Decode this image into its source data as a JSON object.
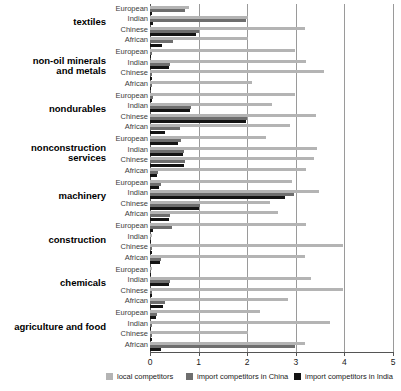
{
  "chart_data": {
    "type": "bar",
    "orientation": "horizontal",
    "title": "",
    "subtitle": "",
    "xlabel": "",
    "ylabel": "",
    "xlim": [
      0,
      5
    ],
    "xticks": [
      0,
      1,
      2,
      3,
      4,
      5
    ],
    "xtick_labels": [
      "0",
      "1",
      "2",
      "3",
      "4",
      "5"
    ],
    "grid": true,
    "grid_axis": "x",
    "legend_position": "bottom",
    "legend": [
      {
        "name": "local competitors",
        "color": "#b4b4b4"
      },
      {
        "name": "import competitors in China",
        "color": "#6e6e6e"
      },
      {
        "name": "import competitors in India",
        "color": "#141414"
      }
    ],
    "series": [
      {
        "name": "local competitors",
        "color": "#b4b4b4"
      },
      {
        "name": "import competitors in China",
        "color": "#6e6e6e"
      },
      {
        "name": "import competitors in India",
        "color": "#141414"
      }
    ],
    "subcategories": [
      "European",
      "Indian",
      "Chinese",
      "African"
    ],
    "categories": [
      "textiles",
      "non-oil minerals and metals",
      "nondurables",
      "nonconstruction services",
      "machinery",
      "construction",
      "chemicals",
      "agriculture and food"
    ],
    "groups": [
      {
        "category": "textiles",
        "category_lines": [
          "textiles"
        ],
        "rows": [
          {
            "subcategory": "European",
            "local competitors": 0.8,
            "import competitors in China": 0.72,
            "import competitors in India": 0.05
          },
          {
            "subcategory": "Indian",
            "local competitors": 2.02,
            "import competitors in China": 1.98,
            "import competitors in India": 0.06
          },
          {
            "subcategory": "Chinese",
            "local competitors": 3.18,
            "import competitors in China": 1.0,
            "import competitors in India": 0.95
          },
          {
            "subcategory": "African",
            "local competitors": 2.02,
            "import competitors in China": 0.48,
            "import competitors in India": 0.24
          }
        ]
      },
      {
        "category": "non-oil minerals and metals",
        "category_lines": [
          "non-oil minerals",
          "and metals"
        ],
        "rows": [
          {
            "subcategory": "European",
            "local competitors": 2.98,
            "import competitors in China": 0.04,
            "import competitors in India": 0.03
          },
          {
            "subcategory": "Indian",
            "local competitors": 3.22,
            "import competitors in China": 0.42,
            "import competitors in India": 0.4
          },
          {
            "subcategory": "Chinese",
            "local competitors": 3.58,
            "import competitors in China": 0.05,
            "import competitors in India": 0.04
          },
          {
            "subcategory": "African",
            "local competitors": 2.1,
            "import competitors in China": 0.04,
            "import competitors in India": 0.03
          }
        ]
      },
      {
        "category": "nondurables",
        "category_lines": [
          "nondurables"
        ],
        "rows": [
          {
            "subcategory": "European",
            "local competitors": 2.98,
            "import competitors in China": 0.06,
            "import competitors in India": 0.04
          },
          {
            "subcategory": "Indian",
            "local competitors": 2.52,
            "import competitors in China": 0.84,
            "import competitors in India": 0.82
          },
          {
            "subcategory": "Chinese",
            "local competitors": 3.42,
            "import competitors in China": 2.0,
            "import competitors in India": 1.98
          },
          {
            "subcategory": "African",
            "local competitors": 2.88,
            "import competitors in China": 0.62,
            "import competitors in India": 0.3
          }
        ]
      },
      {
        "category": "nonconstruction services",
        "category_lines": [
          "nonconstruction",
          "services"
        ],
        "rows": [
          {
            "subcategory": "European",
            "local competitors": 2.38,
            "import competitors in China": 0.64,
            "import competitors in India": 0.58
          },
          {
            "subcategory": "Indian",
            "local competitors": 3.44,
            "import competitors in China": 0.7,
            "import competitors in India": 0.68
          },
          {
            "subcategory": "Chinese",
            "local competitors": 3.38,
            "import competitors in China": 0.72,
            "import competitors in India": 0.7
          },
          {
            "subcategory": "African",
            "local competitors": 3.22,
            "import competitors in China": 0.16,
            "import competitors in India": 0.14
          }
        ]
      },
      {
        "category": "machinery",
        "category_lines": [
          "machinery"
        ],
        "rows": [
          {
            "subcategory": "European",
            "local competitors": 2.92,
            "import competitors in China": 0.22,
            "import competitors in India": 0.18
          },
          {
            "subcategory": "Indian",
            "local competitors": 3.48,
            "import competitors in China": 2.96,
            "import competitors in India": 2.78
          },
          {
            "subcategory": "Chinese",
            "local competitors": 2.46,
            "import competitors in China": 1.02,
            "import competitors in India": 1.0
          },
          {
            "subcategory": "African",
            "local competitors": 2.64,
            "import competitors in China": 0.42,
            "import competitors in India": 0.4
          }
        ]
      },
      {
        "category": "construction",
        "category_lines": [
          "construction"
        ],
        "rows": [
          {
            "subcategory": "European",
            "local competitors": 3.22,
            "import competitors in China": 0.46,
            "import competitors in India": 0.06
          },
          {
            "subcategory": "Indian",
            "local competitors": 0.04,
            "import competitors in China": 0.03,
            "import competitors in India": 0.02
          },
          {
            "subcategory": "Chinese",
            "local competitors": 3.98,
            "import competitors in China": 0.05,
            "import competitors in India": 0.04
          },
          {
            "subcategory": "African",
            "local competitors": 3.18,
            "import competitors in China": 0.22,
            "import competitors in India": 0.2
          }
        ]
      },
      {
        "category": "chemicals",
        "category_lines": [
          "chemicals"
        ],
        "rows": [
          {
            "subcategory": "European",
            "local competitors": 0.04,
            "import competitors in China": 0.03,
            "import competitors in India": 0.02
          },
          {
            "subcategory": "Indian",
            "local competitors": 3.32,
            "import competitors in China": 0.42,
            "import competitors in India": 0.4
          },
          {
            "subcategory": "Chinese",
            "local competitors": 3.98,
            "import competitors in China": 0.05,
            "import competitors in India": 0.04
          },
          {
            "subcategory": "African",
            "local competitors": 2.84,
            "import competitors in China": 0.3,
            "import competitors in India": 0.26
          }
        ]
      },
      {
        "category": "agriculture and food",
        "category_lines": [
          "agriculture and food"
        ],
        "rows": [
          {
            "subcategory": "European",
            "local competitors": 2.26,
            "import competitors in China": 0.14,
            "import competitors in India": 0.12
          },
          {
            "subcategory": "Indian",
            "local competitors": 3.7,
            "import competitors in China": 0.04,
            "import competitors in India": 0.03
          },
          {
            "subcategory": "Chinese",
            "local competitors": 2.02,
            "import competitors in China": 0.05,
            "import competitors in India": 0.04
          },
          {
            "subcategory": "African",
            "local competitors": 3.18,
            "import competitors in China": 2.98,
            "import competitors in India": 0.22
          }
        ]
      }
    ]
  }
}
